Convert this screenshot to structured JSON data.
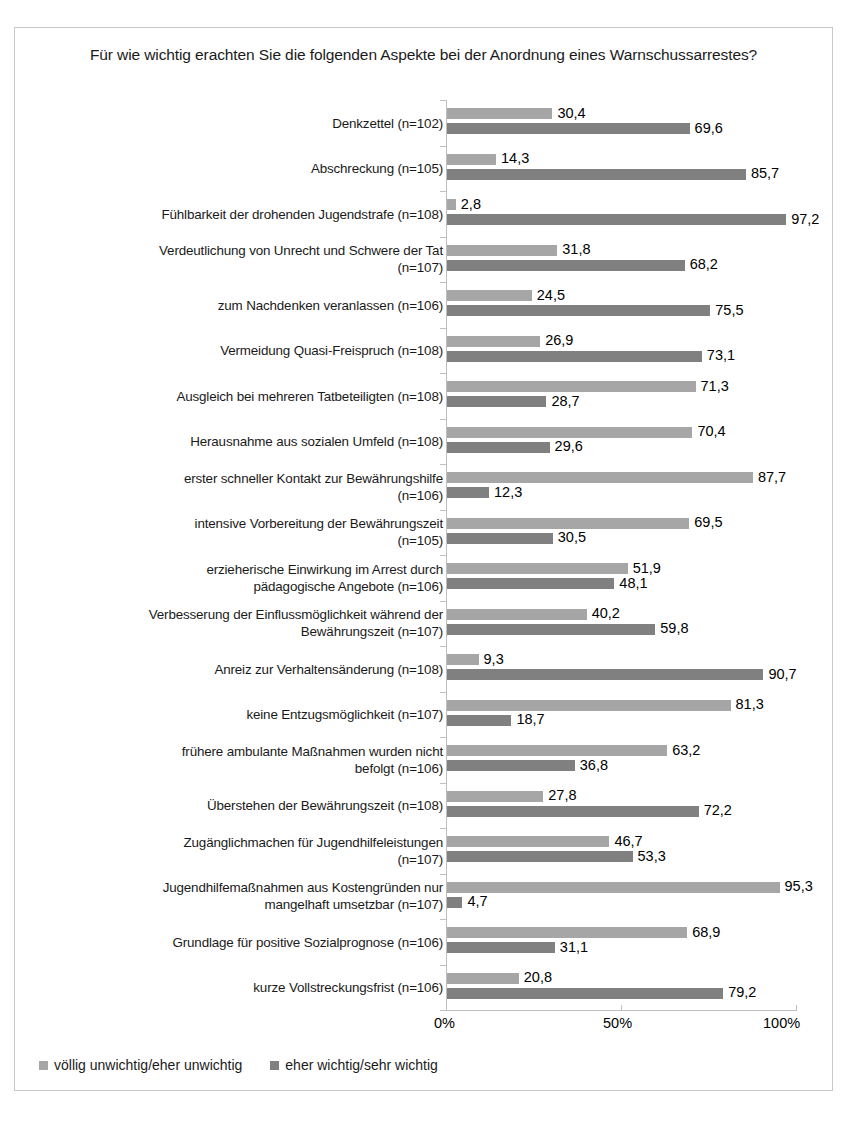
{
  "chart_data": {
    "type": "bar",
    "orientation": "horizontal",
    "title": "Für wie wichtig erachten Sie die folgenden Aspekte bei der Anordnung eines Warnschussarrestes?",
    "xlabel": "",
    "ylabel": "",
    "xlim": [
      0,
      100
    ],
    "xticks": [
      "0%",
      "50%",
      "100%"
    ],
    "xtick_values": [
      0,
      50,
      100
    ],
    "grid": false,
    "legend_position": "bottom-left",
    "colors": {
      "series_light": "#a6a6a6",
      "series_dark": "#808080",
      "frame": "#c8c8c8",
      "axis": "#bfbfbf",
      "text": "#1a1a1a"
    },
    "categories": [
      "Denkzettel (n=102)",
      "Abschreckung (n=105)",
      "Fühlbarkeit der drohenden Jugendstrafe (n=108)",
      "Verdeutlichung von Unrecht und Schwere der Tat\n(n=107)",
      "zum Nachdenken veranlassen (n=106)",
      "Vermeidung Quasi-Freispruch (n=108)",
      "Ausgleich bei mehreren Tatbeteiligten (n=108)",
      "Herausnahme aus sozialen Umfeld (n=108)",
      "erster schneller Kontakt zur Bewährungshilfe\n(n=106)",
      "intensive Vorbereitung der Bewährungszeit\n(n=105)",
      "erzieherische Einwirkung im Arrest durch\npädagogische Angebote (n=106)",
      "Verbesserung der Einflussmöglichkeit während der\nBewährungszeit (n=107)",
      "Anreiz zur Verhaltensänderung (n=108)",
      "keine Entzugsmöglichkeit (n=107)",
      "frühere ambulante Maßnahmen wurden nicht\nbefolgt (n=106)",
      "Überstehen der Bewährungszeit (n=108)",
      "Zugänglichmachen für Jugendhilfeleistungen\n(n=107)",
      "Jugendhilfemaßnahmen aus Kostengründen nur\nmangelhaft umsetzbar (n=107)",
      "Grundlage für positive Sozialprognose (n=106)",
      "kurze Vollstreckungsfrist (n=106)"
    ],
    "series": [
      {
        "name": "völlig unwichtig/eher unwichtig",
        "color": "#a6a6a6",
        "values": [
          30.4,
          14.3,
          2.8,
          31.8,
          24.5,
          26.9,
          71.3,
          70.4,
          87.7,
          69.5,
          51.9,
          40.2,
          9.3,
          81.3,
          63.2,
          27.8,
          46.7,
          95.3,
          68.9,
          20.8
        ],
        "labels": [
          "30,4",
          "14,3",
          "2,8",
          "31,8",
          "24,5",
          "26,9",
          "71,3",
          "70,4",
          "87,7",
          "69,5",
          "51,9",
          "40,2",
          "9,3",
          "81,3",
          "63,2",
          "27,8",
          "46,7",
          "95,3",
          "68,9",
          "20,8"
        ]
      },
      {
        "name": "eher wichtig/sehr wichtig",
        "color": "#808080",
        "values": [
          69.6,
          85.7,
          97.2,
          68.2,
          75.5,
          73.1,
          28.7,
          29.6,
          12.3,
          30.5,
          48.1,
          59.8,
          90.7,
          18.7,
          36.8,
          72.2,
          53.3,
          4.7,
          31.1,
          79.2
        ],
        "labels": [
          "69,6",
          "85,7",
          "97,2",
          "68,2",
          "75,5",
          "73,1",
          "28,7",
          "29,6",
          "12,3",
          "30,5",
          "48,1",
          "59,8",
          "90,7",
          "18,7",
          "36,8",
          "72,2",
          "53,3",
          "4,7",
          "31,1",
          "79,2"
        ]
      }
    ]
  },
  "legend": {
    "items": [
      {
        "label": "völlig unwichtig/eher unwichtig",
        "swatch": "light"
      },
      {
        "label": "eher wichtig/sehr wichtig",
        "swatch": "dark"
      }
    ]
  }
}
